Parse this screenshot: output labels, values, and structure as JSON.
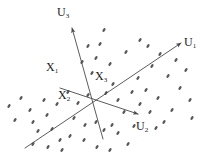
{
  "figure": {
    "title": "",
    "background_color": "#ffffff",
    "ink_color": "#4a4a4a",
    "text_color": "#1a1a1a",
    "width": 214,
    "height": 163
  },
  "axes": [
    {
      "id": "u1",
      "label_base": "U",
      "label_sub": "1",
      "label_text": "U1",
      "from": [
        25,
        148
      ],
      "to": [
        181,
        43
      ],
      "arrow": "end"
    },
    {
      "id": "u2",
      "label_base": "U",
      "label_sub": "2",
      "label_text": "U2",
      "from": [
        60,
        88
      ],
      "to": [
        138,
        114
      ],
      "arrow": "end"
    },
    {
      "id": "u3",
      "label_base": "U",
      "label_sub": "3",
      "label_text": "U3",
      "from": [
        103,
        139
      ],
      "to": [
        72,
        28
      ],
      "arrow": "end"
    }
  ],
  "origin": [
    102,
    105
  ],
  "point_labels": [
    {
      "id": "x1",
      "label_base": "X",
      "label_sub": "1",
      "label_text": "X1"
    },
    {
      "id": "x2",
      "label_base": "X",
      "label_sub": "2",
      "label_text": "X2"
    },
    {
      "id": "x3",
      "label_base": "X",
      "label_sub": "3",
      "label_text": "X3"
    }
  ],
  "chart_data": {
    "type": "scatter",
    "title": "",
    "xlabel": "",
    "ylabel": "",
    "grid": false,
    "legend": null,
    "marker": {
      "shape": "ellipse",
      "rx": 2.2,
      "ry": 1.2,
      "rotation_deg": -55,
      "color": "#5a5a5a"
    },
    "note": "Elongated elliptical markers forming a diffuse 3D point cloud around the origin of the U1/U2/U3 axis frame.",
    "points": [
      [
        9,
        106
      ],
      [
        21,
        98
      ],
      [
        30,
        110
      ],
      [
        15,
        120
      ],
      [
        33,
        122
      ],
      [
        44,
        100
      ],
      [
        47,
        115
      ],
      [
        38,
        131
      ],
      [
        52,
        129
      ],
      [
        57,
        104
      ],
      [
        60,
        140
      ],
      [
        70,
        136
      ],
      [
        48,
        147
      ],
      [
        62,
        150
      ],
      [
        33,
        144
      ],
      [
        74,
        118
      ],
      [
        85,
        125
      ],
      [
        78,
        103
      ],
      [
        88,
        95
      ],
      [
        92,
        73
      ],
      [
        96,
        58
      ],
      [
        88,
        46
      ],
      [
        82,
        62
      ],
      [
        100,
        44
      ],
      [
        104,
        30
      ],
      [
        110,
        64
      ],
      [
        113,
        84
      ],
      [
        106,
        93
      ],
      [
        118,
        100
      ],
      [
        124,
        112
      ],
      [
        112,
        125
      ],
      [
        104,
        130
      ],
      [
        96,
        122
      ],
      [
        118,
        133
      ],
      [
        128,
        144
      ],
      [
        110,
        150
      ],
      [
        97,
        147
      ],
      [
        134,
        126
      ],
      [
        140,
        104
      ],
      [
        132,
        92
      ],
      [
        138,
        78
      ],
      [
        146,
        90
      ],
      [
        150,
        112
      ],
      [
        158,
        98
      ],
      [
        152,
        66
      ],
      [
        160,
        54
      ],
      [
        148,
        46
      ],
      [
        168,
        76
      ],
      [
        172,
        110
      ],
      [
        180,
        88
      ],
      [
        186,
        70
      ],
      [
        176,
        60
      ],
      [
        190,
        100
      ],
      [
        164,
        122
      ],
      [
        192,
        118
      ],
      [
        126,
        52
      ],
      [
        140,
        40
      ],
      [
        156,
        128
      ],
      [
        84,
        140
      ],
      [
        68,
        92
      ]
    ]
  }
}
